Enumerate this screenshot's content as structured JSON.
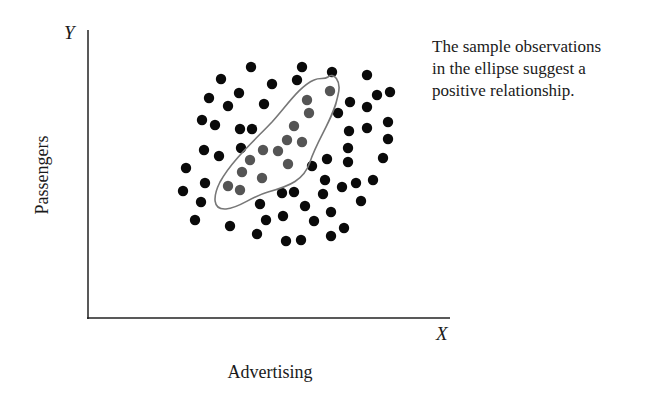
{
  "annotation": {
    "lines": [
      "The sample observations",
      "in the ellipse suggest a",
      "positive relationship."
    ]
  },
  "axes": {
    "y_letter": "Y",
    "x_letter": "X",
    "ylabel": "Passengers",
    "xlabel": "Advertising"
  },
  "colors": {
    "dot": "#0a0a0a",
    "highlighted_dot": "#555555",
    "ellipse": "#777777",
    "axis": "#222222"
  },
  "chart_data": {
    "type": "scatter",
    "title": "",
    "xlabel": "Advertising",
    "ylabel": "Passengers",
    "axis_letters": {
      "x": "X",
      "y": "Y"
    },
    "annotation": "The sample observations in the ellipse suggest a positive relationship.",
    "grid": false,
    "ticks": false,
    "series": [
      {
        "name": "sample observations",
        "color": "#0a0a0a",
        "points": [
          [
            221,
            79
          ],
          [
            251,
            67
          ],
          [
            209,
            98
          ],
          [
            239,
            93
          ],
          [
            228,
            106
          ],
          [
            202,
            120
          ],
          [
            215,
            125
          ],
          [
            240,
            129
          ],
          [
            252,
            129
          ],
          [
            272,
            84
          ],
          [
            302,
            67
          ],
          [
            297,
            80
          ],
          [
            264,
            104
          ],
          [
            332,
            72
          ],
          [
            367,
            75
          ],
          [
            377,
            95
          ],
          [
            390,
            92
          ],
          [
            350,
            102
          ],
          [
            338,
            113
          ],
          [
            367,
            107
          ],
          [
            349,
            131
          ],
          [
            367,
            128
          ],
          [
            388,
            122
          ],
          [
            204,
            150
          ],
          [
            219,
            156
          ],
          [
            241,
            148
          ],
          [
            186,
            168
          ],
          [
            205,
            183
          ],
          [
            183,
            191
          ],
          [
            312,
            166
          ],
          [
            327,
            159
          ],
          [
            348,
            148
          ],
          [
            388,
            139
          ],
          [
            383,
            158
          ],
          [
            348,
            162
          ],
          [
            325,
            180
          ],
          [
            342,
            187
          ],
          [
            356,
            183
          ],
          [
            373,
            180
          ],
          [
            294,
            192
          ],
          [
            282,
            193
          ],
          [
            323,
            194
          ],
          [
            361,
            201
          ],
          [
            201,
            202
          ],
          [
            195,
            220
          ],
          [
            230,
            226
          ],
          [
            260,
            204
          ],
          [
            266,
            220
          ],
          [
            257,
            234
          ],
          [
            305,
            206
          ],
          [
            283,
            216
          ],
          [
            331,
            212
          ],
          [
            314,
            221
          ],
          [
            344,
            228
          ],
          [
            331,
            236
          ],
          [
            286,
            241
          ],
          [
            301,
            240
          ]
        ]
      },
      {
        "name": "observations in ellipse",
        "color": "#555555",
        "points": [
          [
            330,
            91
          ],
          [
            307,
            100
          ],
          [
            309,
            113
          ],
          [
            294,
            126
          ],
          [
            287,
            140
          ],
          [
            302,
            142
          ],
          [
            263,
            150
          ],
          [
            278,
            151
          ],
          [
            288,
            164
          ],
          [
            250,
            160
          ],
          [
            242,
            172
          ],
          [
            262,
            178
          ],
          [
            228,
            186
          ],
          [
            240,
            190
          ]
        ]
      }
    ],
    "ellipse_outline": "M 328 77 C 333 72, 342 80, 338 95 C 334 118, 318 138, 310 162 C 304 180, 290 186, 268 192 C 250 197, 240 208, 226 209 C 212 210, 213 196, 220 182 C 232 160, 255 140, 272 122 C 288 104, 300 86, 314 80 C 320 77, 324 80, 328 77 Z",
    "note": "points in pixel coordinates of the 664x400 image; origin of plot at (88,318), y increases downward"
  }
}
